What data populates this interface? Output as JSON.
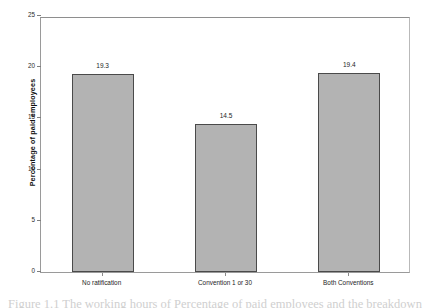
{
  "chart_data": {
    "type": "bar",
    "title": "",
    "subtitle": "",
    "xlabel": "",
    "ylabel": "Percentage of paid employees",
    "categories": [
      "No ratification",
      "Convention 1 or 30",
      "Both Conventions"
    ],
    "values": [
      19.3,
      14.5,
      19.4
    ],
    "value_labels": [
      "19.3",
      "14.5",
      "19.4"
    ],
    "ylim": [
      0,
      25
    ],
    "ytick_labels": [
      "25",
      "20",
      "15",
      "10",
      "5",
      "0"
    ],
    "ytick_values": [
      25,
      20,
      15,
      10,
      5,
      0
    ],
    "grid": false,
    "legend": "none",
    "bar_fill_color": "#b3b3b3",
    "bar_border_color": "#4a4a4a",
    "axis_color": "#9a9a9a"
  },
  "caption": {
    "text": "Figure 1.1  The working hours of Percentage of paid employees and the breakdown"
  }
}
